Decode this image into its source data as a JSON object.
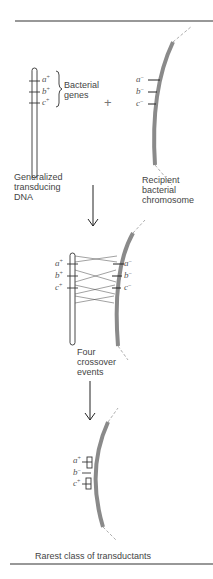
{
  "figure": {
    "panel1": {
      "donor_label": "Generalized transducing DNA",
      "donor_label_lines": [
        "Generalized",
        "transducing",
        "DNA"
      ],
      "brace_label_lines": [
        "Bacterial",
        "genes"
      ],
      "plus_sign": "+",
      "recipient_label_lines": [
        "Recipient",
        "bacterial",
        "chromosome"
      ],
      "donor_genes": [
        {
          "name": "a",
          "allele": "+"
        },
        {
          "name": "b",
          "allele": "+"
        },
        {
          "name": "c",
          "allele": "+"
        }
      ],
      "recipient_genes": [
        {
          "name": "a",
          "allele": "−"
        },
        {
          "name": "b",
          "allele": "−"
        },
        {
          "name": "c",
          "allele": "−"
        }
      ]
    },
    "panel2": {
      "caption_lines": [
        "Four",
        "crossover",
        "events"
      ],
      "donor_genes": [
        {
          "name": "a",
          "allele": "+"
        },
        {
          "name": "b",
          "allele": "+"
        },
        {
          "name": "c",
          "allele": "+"
        }
      ],
      "recipient_genes": [
        {
          "name": "a",
          "allele": "−"
        },
        {
          "name": "b",
          "allele": "−"
        },
        {
          "name": "c",
          "allele": "−"
        }
      ]
    },
    "panel3": {
      "caption": "Rarest class of transductants",
      "genes": [
        {
          "name": "a",
          "allele": "+"
        },
        {
          "name": "b",
          "allele": "−"
        },
        {
          "name": "c",
          "allele": "+"
        }
      ]
    },
    "colors": {
      "chromosome": "#8a8a8a",
      "line": "#222222",
      "rule": "#333333"
    }
  }
}
